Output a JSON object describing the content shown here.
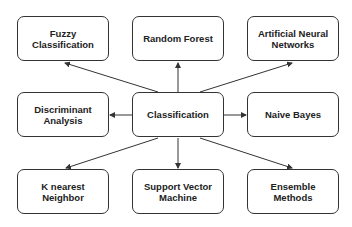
{
  "diagram": {
    "center": {
      "id": "classification",
      "label": "Classification"
    },
    "nodes": [
      {
        "id": "fuzzy",
        "label": "Fuzzy\nClassification",
        "x": 17,
        "y": 16
      },
      {
        "id": "random-forest",
        "label": "Random Forest",
        "x": 132,
        "y": 16
      },
      {
        "id": "ann",
        "label": "Artificial Neural\nNetworks",
        "x": 247,
        "y": 16
      },
      {
        "id": "discriminant",
        "label": "Discriminant\nAnalysis",
        "x": 17,
        "y": 92
      },
      {
        "id": "classification",
        "label": "Classification",
        "x": 132,
        "y": 92
      },
      {
        "id": "naive-bayes",
        "label": "Naive Bayes",
        "x": 247,
        "y": 92
      },
      {
        "id": "knn",
        "label": "K nearest\nNeighbor",
        "x": 17,
        "y": 169
      },
      {
        "id": "svm",
        "label": "Support Vector\nMachine",
        "x": 132,
        "y": 169
      },
      {
        "id": "ensemble",
        "label": "Ensemble\nMethods",
        "x": 247,
        "y": 169
      }
    ],
    "edges": [
      {
        "from": "classification",
        "to": "fuzzy"
      },
      {
        "from": "classification",
        "to": "random-forest"
      },
      {
        "from": "classification",
        "to": "ann"
      },
      {
        "from": "classification",
        "to": "discriminant"
      },
      {
        "from": "classification",
        "to": "naive-bayes"
      },
      {
        "from": "classification",
        "to": "knn"
      },
      {
        "from": "classification",
        "to": "svm"
      },
      {
        "from": "classification",
        "to": "ensemble"
      }
    ],
    "colors": {
      "stroke": "#333333",
      "text": "#222222",
      "background": "#ffffff"
    }
  }
}
